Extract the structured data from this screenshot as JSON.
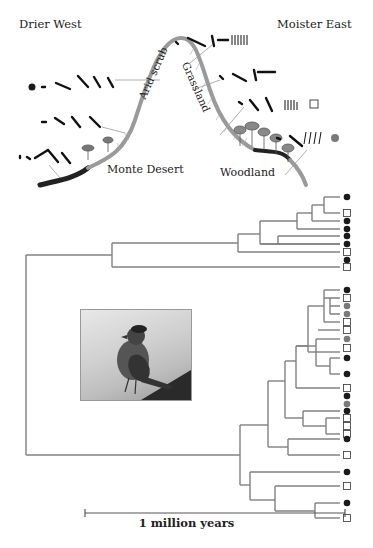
{
  "header": {
    "left_label": "Drier West",
    "right_label": "Moister East"
  },
  "habitats": [
    {
      "name": "Monte Desert"
    },
    {
      "name": "Arid scrub"
    },
    {
      "name": "Grassland"
    },
    {
      "name": "Woodland"
    }
  ],
  "song_legend": [
    {
      "habitat": "Arid scrub",
      "marker": "black-dot"
    },
    {
      "habitat": "Grassland",
      "marker": "none"
    },
    {
      "habitat": "Woodland",
      "marker": "open-square"
    },
    {
      "habitat": "Woodland",
      "marker": "gray-dot"
    }
  ],
  "tree": {
    "tips_upper_clade": [
      "black",
      "open",
      "black",
      "black",
      "black",
      "black",
      "open",
      "black",
      "open"
    ],
    "tips_lower_clade": [
      "black",
      "open",
      "gray",
      "gray",
      "open",
      "open",
      "gray",
      "open",
      "black",
      "black",
      "open",
      "black",
      "gray",
      "black",
      "open",
      "open",
      "open",
      "black",
      "open",
      "black",
      "open",
      "black",
      "open"
    ],
    "colors": {
      "black": "#1a1a1a",
      "gray": "#7a7a7a",
      "open": "#ffffff",
      "branch": "#808080"
    }
  },
  "photo": {
    "alt": "Rufous-collared sparrow photo"
  },
  "scale_bar": {
    "label": "1 million years"
  }
}
